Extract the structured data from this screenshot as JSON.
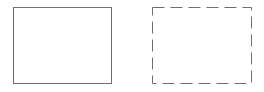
{
  "diagram": {
    "shapes": [
      {
        "id": "solid-rectangle",
        "style": "solid",
        "x": 13,
        "y": 7,
        "width": 98,
        "height": 76,
        "stroke": "#6e6e6e",
        "fill": "#ffffff"
      },
      {
        "id": "dashed-rectangle",
        "style": "dashed",
        "x": 152,
        "y": 7,
        "width": 99,
        "height": 76,
        "stroke": "#6e6e6e",
        "fill": "#ffffff",
        "dash": "12,6"
      }
    ]
  }
}
